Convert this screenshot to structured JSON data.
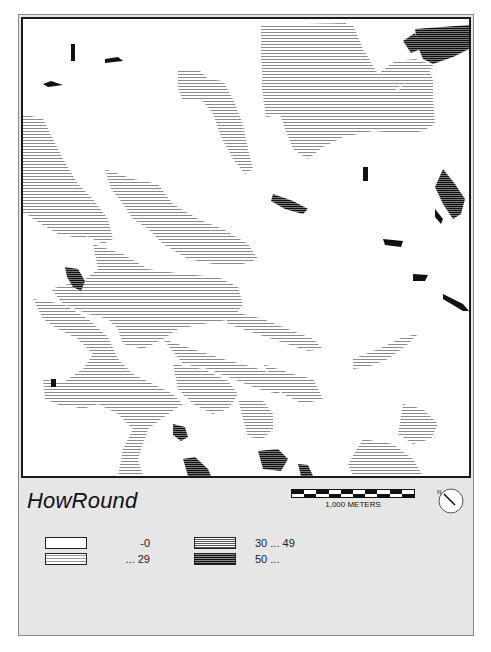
{
  "map": {
    "title": "HowRound",
    "scale": {
      "label": "1,000 METERS",
      "segments": 10
    },
    "north_arrow": {
      "label": "N",
      "icon": "north-arrow-icon"
    },
    "legend": [
      {
        "label": "-0",
        "pattern": "white"
      },
      {
        "label": "... 29",
        "pattern": "light-horizontal-lines"
      },
      {
        "label": "30 ... 49",
        "pattern": "medium-horizontal-lines"
      },
      {
        "label": "50 ...",
        "pattern": "dark-horizontal-lines"
      }
    ],
    "colors": {
      "frame_bg": "#e6e6e6",
      "map_bg": "#ffffff",
      "light_hatch": "#8c8c8c",
      "dark_hatch": "#111111",
      "border": "#1a1a1a"
    }
  }
}
